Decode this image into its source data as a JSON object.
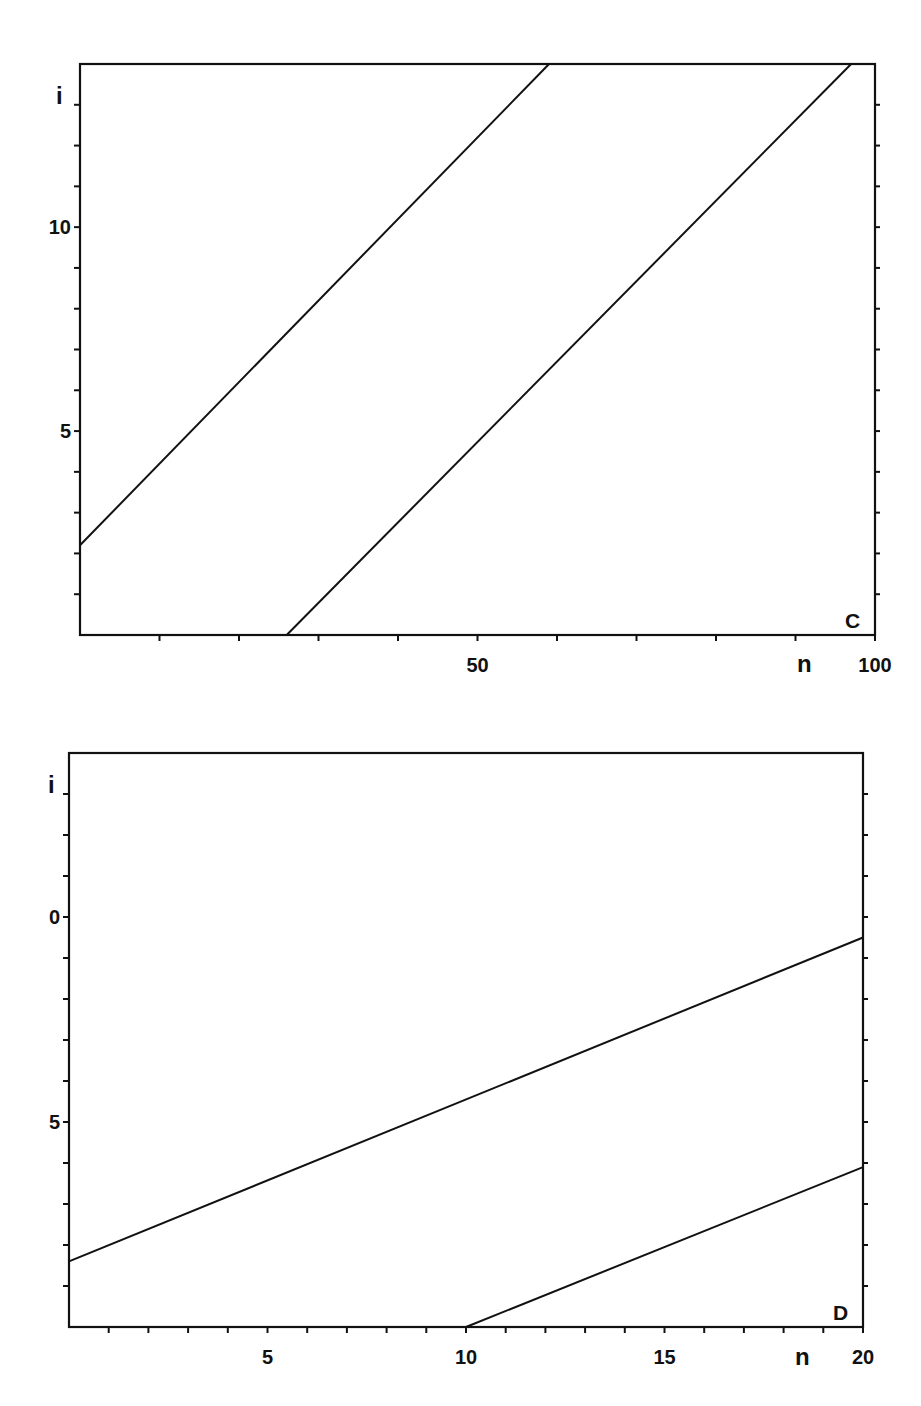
{
  "chart_data": [
    {
      "type": "line",
      "panel_label": "C",
      "title": "",
      "xlabel": "n",
      "ylabel": "i",
      "xlim": [
        0,
        100
      ],
      "ylim": [
        0,
        14
      ],
      "x_ticks": [
        0,
        10,
        20,
        30,
        40,
        50,
        60,
        70,
        80,
        90,
        100
      ],
      "x_tick_labels": [
        {
          "value": 50,
          "label": "50"
        },
        {
          "value": 100,
          "label": "100"
        }
      ],
      "y_ticks": [
        1,
        2,
        3,
        4,
        5,
        6,
        7,
        8,
        9,
        10,
        11,
        12,
        13
      ],
      "y_tick_labels": [
        {
          "value": 10,
          "label": "10"
        },
        {
          "value": 5,
          "label": "5"
        }
      ],
      "grid": false,
      "legend": null,
      "series": [
        {
          "name": "upper line",
          "x": [
            0,
            59
          ],
          "y": [
            2.2,
            14
          ],
          "stroke_width": 1.6
        },
        {
          "name": "lower line",
          "x": [
            26,
            97
          ],
          "y": [
            0,
            14
          ],
          "stroke_width": 2.2
        }
      ]
    },
    {
      "type": "line",
      "panel_label": "D",
      "title": "",
      "xlabel": "n",
      "ylabel": "i",
      "xlim": [
        0,
        20
      ],
      "ylim": [
        0,
        14
      ],
      "x_ticks": [
        1,
        2,
        3,
        4,
        5,
        6,
        7,
        8,
        9,
        10,
        11,
        12,
        13,
        14,
        15,
        16,
        17,
        18,
        19,
        20
      ],
      "x_tick_labels": [
        {
          "value": 5,
          "label": "5"
        },
        {
          "value": 10,
          "label": "10"
        },
        {
          "value": 15,
          "label": "15"
        },
        {
          "value": 20,
          "label": "20"
        }
      ],
      "y_ticks": [
        1,
        2,
        3,
        4,
        5,
        6,
        7,
        8,
        9,
        10,
        11,
        12,
        13
      ],
      "y_tick_labels": [
        {
          "value": 10,
          "label": "0"
        },
        {
          "value": 5,
          "label": "5"
        }
      ],
      "grid": false,
      "legend": null,
      "series": [
        {
          "name": "upper line",
          "x": [
            0,
            20
          ],
          "y": [
            1.6,
            9.5
          ],
          "stroke_width": 1.6
        },
        {
          "name": "lower line",
          "x": [
            10,
            20
          ],
          "y": [
            0,
            3.9
          ],
          "stroke_width": 2.2
        }
      ]
    }
  ],
  "layout": {
    "panels": [
      {
        "left": 80,
        "top": 64,
        "right": 875,
        "bottom": 635,
        "xlabel_pos": [
          797,
          672
        ],
        "ylabel_pos": [
          56,
          104
        ],
        "panel_label_pos": [
          845,
          628
        ]
      },
      {
        "left": 69,
        "top": 753,
        "right": 863,
        "bottom": 1327,
        "xlabel_pos": [
          795,
          1365
        ],
        "ylabel_pos": [
          48,
          793
        ],
        "panel_label_pos": [
          833,
          1320
        ]
      }
    ]
  }
}
